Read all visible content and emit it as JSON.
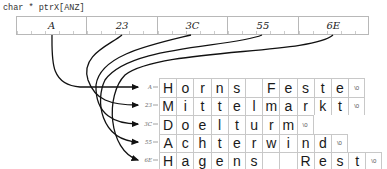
{
  "declaration": "char * ptrX[ANZ]",
  "pointer_array": [
    {
      "value": "A"
    },
    {
      "value": "23"
    },
    {
      "value": "3C"
    },
    {
      "value": "55"
    },
    {
      "value": "6E"
    }
  ],
  "strings": [
    {
      "address": "A",
      "chars": [
        "H",
        "o",
        "r",
        "n",
        "s",
        " ",
        "F",
        "e",
        "s",
        "t",
        "e",
        "\\0"
      ]
    },
    {
      "address": "23",
      "chars": [
        "M",
        "i",
        "t",
        "t",
        "e",
        "l",
        "m",
        "a",
        "r",
        "k",
        "t",
        "\\0"
      ]
    },
    {
      "address": "3C",
      "chars": [
        "D",
        "o",
        "e",
        "l",
        "t",
        "u",
        "r",
        "m",
        "\\0"
      ]
    },
    {
      "address": "55",
      "chars": [
        "A",
        "c",
        "h",
        "t",
        "e",
        "r",
        "w",
        "i",
        "n",
        "d",
        "\\0"
      ]
    },
    {
      "address": "6E",
      "chars": [
        "H",
        "a",
        "g",
        "e",
        "n",
        "s",
        " ",
        " ",
        "R",
        "e",
        "s",
        "t",
        "\\0"
      ]
    }
  ]
}
